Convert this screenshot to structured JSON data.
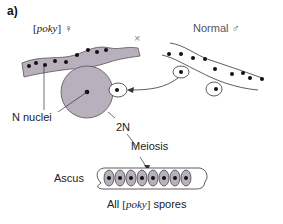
{
  "panel_label": "a)",
  "female_parent": {
    "open": "[",
    "strain": "poky",
    "close": "]",
    "symbol": "♀"
  },
  "cross_symbol": "×",
  "male_parent": {
    "name": "Normal",
    "symbol": "♂"
  },
  "labels": {
    "n_nuclei": "N nuclei",
    "diploid": "2N",
    "meiosis": "Meiosis",
    "ascus": "Ascus"
  },
  "result": {
    "prefix": "All ",
    "open": "[",
    "strain": "poky",
    "close": "]",
    "suffix": " spores"
  },
  "colors": {
    "cytoplasm_grey": "#b8b0bc",
    "outline": "#333333",
    "nucleus": "#111111"
  }
}
